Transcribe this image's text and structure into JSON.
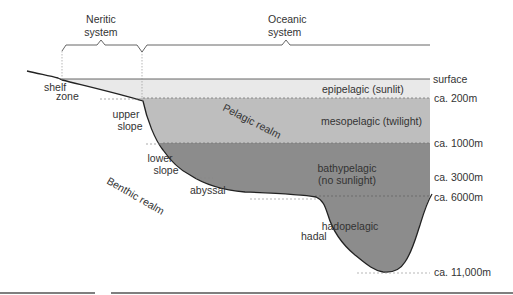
{
  "systems": {
    "neritic": [
      "Neritic",
      "system"
    ],
    "oceanic": [
      "Oceanic",
      "system"
    ]
  },
  "zones": {
    "epipelagic": "epipelagic (sunlit)",
    "mesopelagic": "mesopelagic (twilight)",
    "bathypelagic": [
      "bathypelagic",
      "(no sunlight)"
    ],
    "hadopelagic": "hadopelagic"
  },
  "depths": {
    "surface": "surface",
    "d200": "ca. 200m",
    "d1000": "ca. 1000m",
    "d3000": "ca. 3000m",
    "d6000": "ca. 6000m",
    "d11000": "ca. 11,000m"
  },
  "benthic_zones": {
    "shelf": [
      "shelf",
      "zone"
    ],
    "upper_slope": [
      "upper",
      "slope"
    ],
    "lower_slope": [
      "lower",
      "slope"
    ],
    "abyssal": "abyssal",
    "hadal": "hadal"
  },
  "realms": {
    "pelagic": "Pelagic realm",
    "benthic": "Benthic realm"
  },
  "colors": {
    "epipelagic": "#e9e9e9",
    "mesopelagic": "#bebebe",
    "bathypelagic": "#8c8c8c",
    "seafloor": "#222222"
  }
}
